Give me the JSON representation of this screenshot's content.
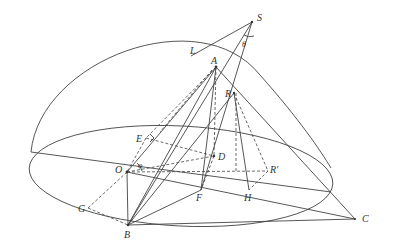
{
  "diagram": {
    "type": "geometry-figure",
    "colors": {
      "stroke": "#444444",
      "hatch": "#b8b8b8",
      "label": "#333333"
    },
    "labels": {
      "S": "S",
      "theta": "θ",
      "L": "L",
      "A": "A",
      "R": "R",
      "E": "E",
      "O": "O",
      "phi": "φ",
      "D": "D",
      "R_prime": "R′",
      "F": "F",
      "H": "H",
      "G": "G",
      "B": "B",
      "C": "C"
    },
    "points": {
      "S": [
        252,
        22
      ],
      "L": [
        191,
        56
      ],
      "A": [
        216,
        67
      ],
      "R": [
        234,
        93
      ],
      "E": [
        146,
        138
      ],
      "O": [
        127,
        172
      ],
      "D": [
        214,
        156
      ],
      "R_prime": [
        268,
        171
      ],
      "F": [
        201,
        190
      ],
      "H": [
        249,
        190
      ],
      "G": [
        88,
        208
      ],
      "B": [
        128,
        225
      ],
      "C": [
        355,
        219
      ]
    }
  }
}
